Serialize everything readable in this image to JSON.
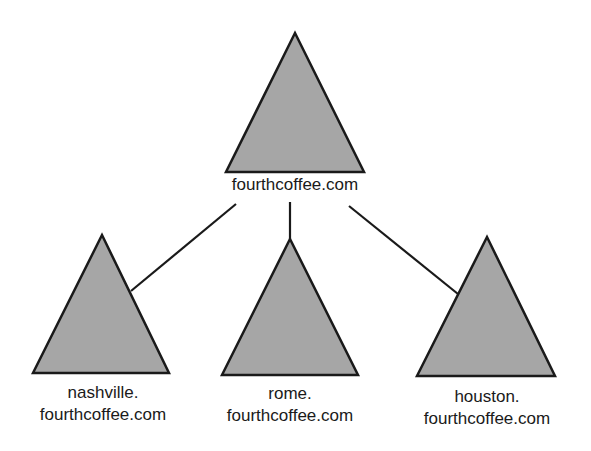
{
  "diagram": {
    "type": "domain-tree",
    "colors": {
      "triangle_fill": "#a6a6a6",
      "stroke": "#1a1a1a",
      "background": "#ffffff"
    },
    "root": {
      "label": "fourthcoffee.com"
    },
    "children": [
      {
        "line1": "nashville.",
        "line2": "fourthcoffee.com"
      },
      {
        "line1": "rome.",
        "line2": "fourthcoffee.com"
      },
      {
        "line1": "houston.",
        "line2": "fourthcoffee.com"
      }
    ]
  }
}
